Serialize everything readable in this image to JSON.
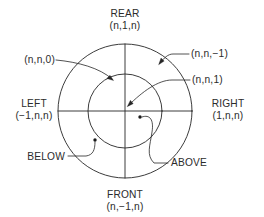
{
  "figure": {
    "colors": {
      "line": "#262626",
      "text": "#2b2b2b",
      "background": "#ffffff",
      "dot": "#1a1a1a"
    },
    "geometry": {
      "center_x": 125,
      "center_y": 111,
      "outer_radius": 67,
      "inner_radius": 37
    }
  },
  "labels": {
    "rear": {
      "name": "REAR",
      "coords": "(n,1,n)"
    },
    "front": {
      "name": "FRONT",
      "coords": "(n,−1,n)"
    },
    "left": {
      "name": "LEFT",
      "coords": "(−1,n,n)"
    },
    "right": {
      "name": "RIGHT",
      "coords": "(1,n,n)"
    },
    "outer_ring": "(n,n,0)",
    "back_plane": "(n,n,−1)",
    "front_plane": "(n,n,1)",
    "above": "ABOVE",
    "below": "BELOW"
  }
}
